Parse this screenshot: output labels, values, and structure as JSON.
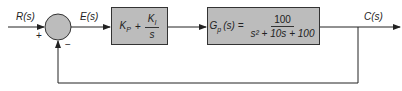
{
  "diagram": {
    "type": "feedback-control-block-diagram",
    "input_label": "R(s)",
    "error_label": "E(s)",
    "output_label": "C(s)",
    "summing_junction": {
      "plus_sign": "+",
      "minus_sign": "−"
    },
    "controller": {
      "lhs": "K",
      "lhs_sub": "P",
      "plus": "+",
      "num": "K",
      "num_sub": "I",
      "den": "s"
    },
    "plant": {
      "lhs": "G",
      "lhs_sub": "p",
      "lhs_arg": "(s) =",
      "num": "100",
      "den": "s² + 10s + 100"
    },
    "colors": {
      "block_fill": "#bcbcbc",
      "junction_fill": "#bcbcbc",
      "line": "#222222"
    }
  }
}
